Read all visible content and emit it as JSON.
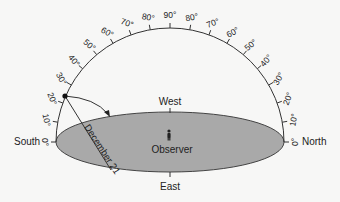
{
  "diagram": {
    "horizon_labels": {
      "south": "South",
      "north": "North",
      "west": "West",
      "east": "East"
    },
    "observer_label": "Observer",
    "path_label": "December 21",
    "altitude_ticks_left": [
      "0°",
      "10°",
      "20°",
      "30°",
      "40°",
      "50°",
      "60°",
      "70°",
      "80°"
    ],
    "altitude_tick_top": "90°",
    "altitude_ticks_right": [
      "80°",
      "70°",
      "60°",
      "50°",
      "40°",
      "30°",
      "20°",
      "10°",
      "0°"
    ],
    "colors": {
      "ground": "#a9a9a9",
      "line": "#333333",
      "background": "#f7f7f6"
    }
  }
}
